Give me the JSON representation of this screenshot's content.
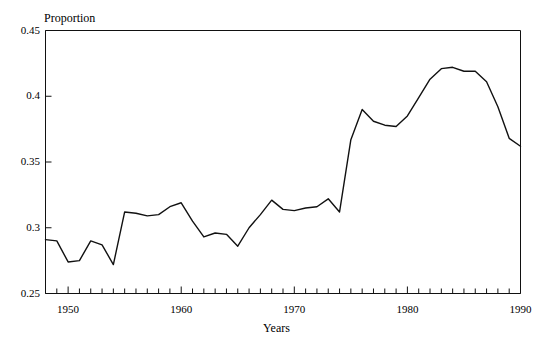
{
  "chart_data": {
    "type": "line",
    "title": "",
    "xlabel": "Years",
    "ylabel": "Proportion",
    "xlim": [
      1948,
      1990
    ],
    "ylim": [
      0.25,
      0.45
    ],
    "grid": false,
    "legend": null,
    "x_ticks_major": [
      1950,
      1960,
      1970,
      1980,
      1990
    ],
    "x_tick_labels": [
      "1950",
      "1960",
      "1970",
      "1980",
      "1990"
    ],
    "x_ticks_minor_step": 1,
    "y_ticks": [
      0.25,
      0.3,
      0.35,
      0.4,
      0.45
    ],
    "y_tick_labels": [
      "0.25",
      "0.3",
      "0.35",
      "0.4",
      "0.45"
    ],
    "line_color": "#111111",
    "line_width": 1.4,
    "x": [
      1948,
      1949,
      1950,
      1951,
      1952,
      1953,
      1954,
      1955,
      1956,
      1957,
      1958,
      1959,
      1960,
      1961,
      1962,
      1963,
      1964,
      1965,
      1966,
      1967,
      1968,
      1969,
      1970,
      1971,
      1972,
      1973,
      1974,
      1975,
      1976,
      1977,
      1978,
      1979,
      1980,
      1981,
      1982,
      1983,
      1984,
      1985,
      1986,
      1987,
      1988,
      1989,
      1990
    ],
    "values": [
      0.291,
      0.29,
      0.274,
      0.275,
      0.29,
      0.287,
      0.272,
      0.312,
      0.311,
      0.309,
      0.31,
      0.316,
      0.319,
      0.305,
      0.293,
      0.296,
      0.295,
      0.286,
      0.3,
      0.31,
      0.321,
      0.314,
      0.313,
      0.315,
      0.316,
      0.322,
      0.312,
      0.367,
      0.39,
      0.381,
      0.378,
      0.377,
      0.385,
      0.399,
      0.413,
      0.421,
      0.422,
      0.419,
      0.419,
      0.411,
      0.392,
      0.368,
      0.362
    ]
  },
  "axes": {
    "y_title": "Proportion",
    "x_title": "Years"
  }
}
